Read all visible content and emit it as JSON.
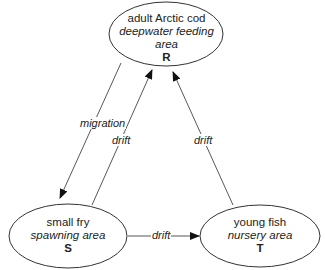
{
  "diagram": {
    "nodes": [
      {
        "id": "R",
        "line1": "adult Arctic cod",
        "line2": "deepwater feeding area",
        "letter": "R"
      },
      {
        "id": "S",
        "line1": "small fry",
        "line2": "spawning area",
        "letter": "S"
      },
      {
        "id": "T",
        "line1": "young fish",
        "line2": "nursery area",
        "letter": "T"
      }
    ],
    "edges": [
      {
        "from": "R",
        "to": "S",
        "label": "migration"
      },
      {
        "from": "S",
        "to": "R",
        "label": "drift"
      },
      {
        "from": "T",
        "to": "R",
        "label": "drift"
      },
      {
        "from": "S",
        "to": "T",
        "label": "drift"
      }
    ]
  }
}
